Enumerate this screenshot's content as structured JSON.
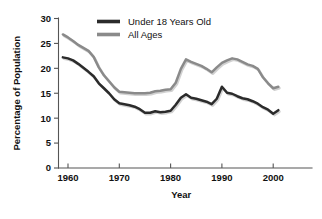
{
  "chart_data": {
    "type": "line",
    "title": "",
    "xlabel": "Year",
    "ylabel": "Percentage of Population",
    "xlim": [
      1959,
      2001
    ],
    "ylim": [
      0,
      30
    ],
    "xticks": [
      "1960",
      "1970",
      "1980",
      "1990",
      "2000"
    ],
    "xtick_values": [
      1960,
      1970,
      1980,
      1990,
      2000
    ],
    "yticks": [
      "0",
      "5",
      "10",
      "15",
      "20",
      "25",
      "30"
    ],
    "ytick_values": [
      0,
      5,
      10,
      15,
      20,
      25,
      30
    ],
    "grid": false,
    "legend_position": "top-center",
    "x": [
      1959,
      1960,
      1961,
      1962,
      1963,
      1964,
      1965,
      1966,
      1967,
      1968,
      1969,
      1970,
      1971,
      1972,
      1973,
      1974,
      1975,
      1976,
      1977,
      1978,
      1979,
      1980,
      1981,
      1982,
      1983,
      1984,
      1985,
      1986,
      1987,
      1988,
      1989,
      1990,
      1991,
      1992,
      1993,
      1994,
      1995,
      1996,
      1997,
      1998,
      1999,
      2000,
      2001
    ],
    "series": [
      {
        "name": "Under 18 Years Old",
        "color": "#2b2b2b",
        "values": [
          22.2,
          22.0,
          21.6,
          20.9,
          20.1,
          19.3,
          18.4,
          17.0,
          16.0,
          15.0,
          13.8,
          13.0,
          12.8,
          12.6,
          12.3,
          11.8,
          11.1,
          11.1,
          11.4,
          11.2,
          11.3,
          11.5,
          12.7,
          14.1,
          14.8,
          14.1,
          13.9,
          13.6,
          13.3,
          12.8,
          13.9,
          16.3,
          15.1,
          14.9,
          14.4,
          14.0,
          13.8,
          13.4,
          12.9,
          12.2,
          11.7,
          10.9,
          11.6
        ]
      },
      {
        "name": "All Ages",
        "color": "#8a8a8a",
        "values": [
          26.8,
          26.2,
          25.5,
          24.7,
          24.1,
          23.5,
          22.3,
          20.2,
          18.6,
          17.4,
          16.2,
          15.3,
          15.2,
          15.1,
          15.0,
          15.0,
          15.0,
          15.1,
          15.4,
          15.5,
          15.7,
          15.8,
          17.1,
          19.9,
          21.8,
          21.3,
          20.9,
          20.5,
          19.9,
          19.2,
          20.2,
          21.1,
          21.6,
          22.0,
          21.8,
          21.3,
          20.8,
          20.5,
          19.9,
          18.2,
          17.0,
          16.0,
          16.3
        ]
      }
    ]
  },
  "legend": {
    "entries": [
      {
        "label": "Under 18 Years Old",
        "swatch_color": "#2b2b2b"
      },
      {
        "label": "All Ages",
        "swatch_color": "#8a8a8a"
      }
    ]
  },
  "axes": {
    "x_title": "Year",
    "y_title": "Percentage of Population",
    "axis_color": "#555555"
  }
}
